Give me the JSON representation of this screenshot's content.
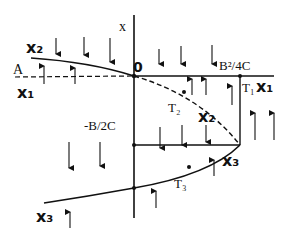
{
  "diagram": {
    "axis_label": "x",
    "origin_label": "0",
    "left_label": "A",
    "top_right_label": "B²/4C",
    "mid_label": "-B/2C",
    "branches": {
      "x1_left": "x₁",
      "x1_right": "x₁",
      "x2_left": "x₂",
      "x2_mid": "x₂",
      "x3_right": "x₃",
      "x3_left": "x₃"
    },
    "points": {
      "t1": "T₁",
      "t2": "T₂",
      "t3": "T₃"
    },
    "colors": {
      "ink": "#111111",
      "background": "#ffffff"
    }
  }
}
